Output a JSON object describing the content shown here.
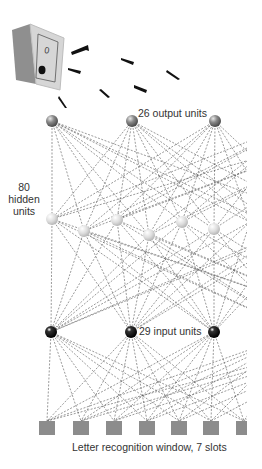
{
  "labels": {
    "output": "26 output units",
    "hidden_line1": "80",
    "hidden_line2": "hidden",
    "hidden_line3": "units",
    "input": "29 input units",
    "window": "Letter recognition window, 7 slots"
  },
  "colors": {
    "connection": "#555555",
    "output_node": "#8a8a8a",
    "hidden_node": "#d8d8d8",
    "input_node": "#111111",
    "slot": "#8c8c8c",
    "speaker_side": "#8f8f8f",
    "speaker_front": "#d6d6d6"
  },
  "speaker": {
    "switch_label": "0"
  },
  "layers": {
    "output": [
      [
        52,
        121
      ],
      [
        132,
        121
      ],
      [
        215,
        121
      ],
      [
        300,
        121
      ],
      [
        380,
        121
      ]
    ],
    "hidden": [
      [
        52,
        219
      ],
      [
        84,
        231
      ],
      [
        117,
        220
      ],
      [
        149,
        235
      ],
      [
        182,
        222
      ],
      [
        214,
        229
      ],
      [
        250,
        222
      ],
      [
        285,
        231
      ],
      [
        320,
        220
      ]
    ],
    "input": [
      [
        51,
        332
      ],
      [
        131,
        332
      ],
      [
        214,
        332
      ],
      [
        300,
        332
      ],
      [
        380,
        332
      ]
    ],
    "slots": [
      [
        47,
        428,
        16
      ],
      [
        81,
        428,
        16
      ],
      [
        114,
        428,
        16
      ],
      [
        147,
        428,
        16
      ],
      [
        179,
        428,
        16
      ],
      [
        211,
        428,
        16
      ],
      [
        244,
        428,
        16
      ]
    ]
  },
  "visible_counts": {
    "output": 3,
    "hidden": 6,
    "input": 3,
    "slots": 7
  }
}
